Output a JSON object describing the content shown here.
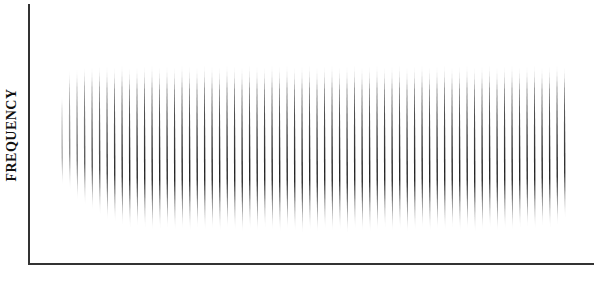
{
  "chart_data": {
    "type": "bar",
    "title": "",
    "xlabel": "",
    "ylabel": "FREQUENCY",
    "grid": false,
    "legend": null,
    "spike_count": 68,
    "spike_spacing_px": 7.5,
    "x_range_px": [
      62,
      568
    ],
    "spikes": {
      "tops": [
        95,
        70,
        68,
        66,
        66,
        65,
        65,
        66,
        64,
        67,
        66,
        65,
        64,
        66,
        65,
        66,
        64,
        65,
        66,
        64,
        65,
        66,
        64,
        65,
        66,
        64,
        65,
        66,
        64,
        65,
        64,
        66,
        65,
        64,
        66,
        65,
        64,
        66,
        65,
        64,
        66,
        65,
        64,
        66,
        65,
        64,
        66,
        65,
        64,
        66,
        65,
        64,
        66,
        65,
        64,
        66,
        65,
        64,
        66,
        65,
        64,
        66,
        65,
        64,
        66,
        65,
        64,
        66
      ],
      "bottoms": [
        185,
        190,
        200,
        205,
        210,
        215,
        220,
        222,
        225,
        228,
        226,
        228,
        230,
        229,
        228,
        230,
        229,
        231,
        228,
        230,
        229,
        231,
        228,
        230,
        232,
        229,
        231,
        228,
        230,
        232,
        229,
        231,
        233,
        230,
        232,
        229,
        231,
        230,
        233,
        229,
        231,
        232,
        230,
        228,
        231,
        229,
        232,
        230,
        228,
        231,
        229,
        230,
        228,
        231,
        229,
        232,
        230,
        228,
        231,
        229,
        230,
        228,
        227,
        229,
        226,
        228,
        225,
        218
      ],
      "intensity": [
        0.35,
        0.5,
        0.6,
        0.7,
        0.75,
        0.8,
        0.85,
        0.9,
        0.9,
        0.95,
        0.95,
        0.95,
        0.95,
        0.95,
        0.95,
        0.95,
        0.95,
        0.95,
        0.95,
        0.95,
        0.95,
        0.95,
        0.95,
        0.95,
        0.95,
        0.95,
        0.95,
        0.95,
        0.95,
        0.95,
        0.95,
        0.95,
        0.95,
        0.95,
        0.95,
        0.95,
        0.95,
        0.95,
        0.95,
        0.95,
        0.95,
        0.95,
        0.95,
        0.95,
        0.95,
        0.95,
        0.95,
        0.95,
        0.95,
        0.95,
        0.95,
        0.95,
        0.95,
        0.95,
        0.95,
        0.95,
        0.95,
        0.95,
        0.95,
        0.95,
        0.95,
        0.95,
        0.95,
        0.95,
        0.95,
        0.95,
        0.95,
        0.9
      ]
    },
    "axes": {
      "y_axis_x_px": 29,
      "y_axis_top_px": 4,
      "x_axis_y_px": 264,
      "x_axis_right_px": 594
    }
  },
  "colors": {
    "spike": "#111111",
    "axis": "#333333",
    "background": "#ffffff"
  },
  "labels": {
    "y_axis": "FREQUENCY",
    "x_axis": ""
  }
}
